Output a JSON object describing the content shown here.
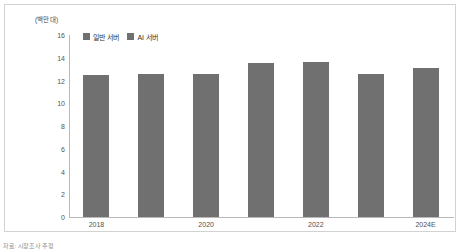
{
  "chart_data": {
    "type": "bar",
    "title": "",
    "subtitle": "",
    "xlabel": "",
    "ylabel": "",
    "unit_label": "(백만 대)",
    "categories": [
      "2018",
      "2019",
      "2020",
      "2021",
      "2022",
      "2023",
      "2024E"
    ],
    "tick_labels": [
      "2018",
      "",
      "2020",
      "",
      "2022",
      "",
      "2024E"
    ],
    "values": [
      12.5,
      12.6,
      12.6,
      13.5,
      13.6,
      12.6,
      13.1
    ],
    "series": [
      {
        "name": "일반 서버",
        "values": [
          12.5,
          12.6,
          12.6,
          13.5,
          13.6,
          12.6,
          13.1
        ]
      }
    ],
    "ylim": [
      0,
      16
    ],
    "yticks": [
      16,
      14,
      12,
      10,
      8,
      6,
      4,
      2,
      0
    ],
    "ytick_labels": [
      "16",
      "14",
      "12",
      "10",
      "8",
      "6",
      "4",
      "2",
      "0"
    ],
    "grid": false,
    "legend": {
      "position": "top-left",
      "entries": [
        {
          "label": "일반 서버",
          "color": "#707070"
        },
        {
          "label": "AI 서버",
          "color": "#707070"
        }
      ]
    },
    "bar_color": "#707070",
    "axis_color": "#b9b9b9",
    "frame_color": "#d2d2d2"
  },
  "footnote": {
    "text": "자료: 시장조사 추정"
  }
}
